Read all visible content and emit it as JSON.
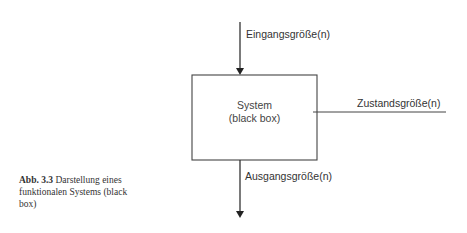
{
  "diagram": {
    "input_label": "Eingangsgröße(n)",
    "system_line1": "System",
    "system_line2": "(black box)",
    "state_label": "Zustandsgröße(n)",
    "output_label": "Ausgangsgröße(n)"
  },
  "caption": {
    "number": "Abb. 3.3",
    "text": "Darstellung eines funktionalen Systems (black box)"
  },
  "colors": {
    "line": "#333333",
    "background": "#ffffff"
  }
}
